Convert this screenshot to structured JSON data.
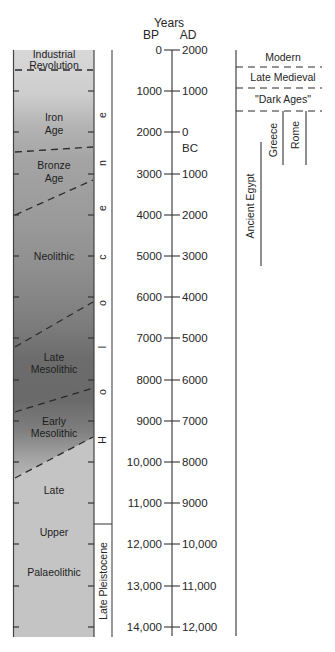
{
  "diagram": {
    "axis": {
      "title": "Years",
      "left_label": "BP",
      "right_label": "AD",
      "era_switch_label": "BC",
      "ticks": [
        {
          "bp": "0",
          "ad": "2000"
        },
        {
          "bp": "1000",
          "ad": "1000"
        },
        {
          "bp": "2000",
          "ad": "0"
        },
        {
          "bp": "3000",
          "ad": "1000"
        },
        {
          "bp": "4000",
          "ad": "2000"
        },
        {
          "bp": "5000",
          "ad": "3000"
        },
        {
          "bp": "6000",
          "ad": "4000"
        },
        {
          "bp": "7000",
          "ad": "5000"
        },
        {
          "bp": "8000",
          "ad": "6000"
        },
        {
          "bp": "9000",
          "ad": "7000"
        },
        {
          "bp": "10,000",
          "ad": "8000"
        },
        {
          "bp": "11,000",
          "ad": "9000"
        },
        {
          "bp": "12,000",
          "ad": "10,000"
        },
        {
          "bp": "13,000",
          "ad": "11,000"
        },
        {
          "bp": "14,000",
          "ad": "12,000"
        }
      ]
    },
    "cultural_periods": [
      {
        "label": "Industrial Revolution"
      },
      {
        "label": "Iron Age"
      },
      {
        "label": "Bronze Age"
      },
      {
        "label": "Neolithic"
      },
      {
        "label": "Late Mesolithic"
      },
      {
        "label": "Early Mesolithic"
      },
      {
        "label": "Late"
      },
      {
        "label": "Upper"
      },
      {
        "label": "Palaeolithic"
      }
    ],
    "epochs": {
      "holocene": {
        "label": "Holocene",
        "letters": [
          "H",
          "o",
          "l",
          "o",
          "c",
          "e",
          "n",
          "e"
        ]
      },
      "late_pleistocene": {
        "label": "Late Pleistocene"
      }
    },
    "historical_periods": [
      {
        "label": "Modern"
      },
      {
        "label": "Late Medieval"
      },
      {
        "label": "\"Dark Ages\""
      },
      {
        "label": "Greece"
      },
      {
        "label": "Rome"
      },
      {
        "label": "Ancient Egypt"
      }
    ],
    "colors": {
      "line": "#333333",
      "shade_light": "#d8d8d8",
      "shade_dark": "#6a6a6a",
      "palaeolithic_shade": "#c4c4c4"
    }
  }
}
